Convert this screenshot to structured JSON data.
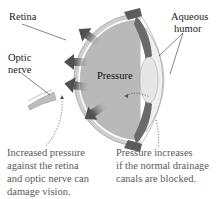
{
  "diagram": {
    "type": "anatomy-eye-cross-section",
    "labels": {
      "retina": "Retina",
      "optic_nerve_line1": "Optic",
      "optic_nerve_line2": "nerve",
      "aqueous_line1": "Aqueous",
      "aqueous_line2": "humor",
      "center": "Pressure"
    },
    "captions": {
      "left": [
        "Increased pressure",
        "against the retina",
        "and optic nerve can",
        "damage vision."
      ],
      "right": [
        "Pressure increases",
        "if the normal drainage",
        "canals are blocked."
      ]
    },
    "arrows": [
      {
        "direction": "up-left"
      },
      {
        "direction": "left"
      },
      {
        "direction": "left"
      },
      {
        "direction": "down-left"
      }
    ],
    "colors": {
      "sclera": "#c9c9c9",
      "vitreous": "#b4b4b4",
      "iris": "#6e6e6e",
      "lens": "#e8e8e8",
      "cornea": "#ececec",
      "arrow": "#555555",
      "caption_text": "#5a5a5a"
    }
  }
}
